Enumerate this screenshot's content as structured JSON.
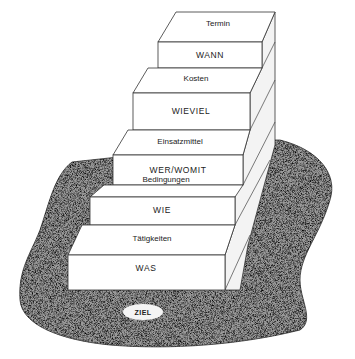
{
  "diagram": {
    "type": "staircase",
    "steps": [
      {
        "level": 1,
        "tread_label": "Termin",
        "riser_label": "WANN"
      },
      {
        "level": 2,
        "tread_label": "Kosten",
        "riser_label": "WIEVIEL"
      },
      {
        "level": 3,
        "tread_label": "Einsatzmittel",
        "riser_label": "WER/WOMIT"
      },
      {
        "level": 4,
        "tread_label": "Bedingungen",
        "riser_label": "WIE"
      },
      {
        "level": 5,
        "tread_label": "Tätigkeiten",
        "riser_label": "WAS"
      }
    ],
    "ground": {
      "label": "ZIEL",
      "texture": "speckled-gray"
    },
    "colors": {
      "step_face": "#ffffff",
      "step_side": "#f2f2f2",
      "outline": "#333333",
      "ground": "#7a7a7a"
    }
  }
}
